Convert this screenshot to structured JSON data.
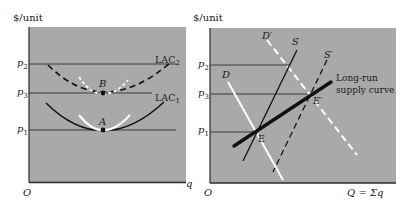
{
  "colors": {
    "background": "#ffffff",
    "panel": "#a9a9a9",
    "axis": "#2a2a2a",
    "price_line": "#3a3a3a",
    "curve_dark": "#111111",
    "curve_white": "#ffffff"
  },
  "left_panel": {
    "y_axis_label": "$/unit",
    "x_axis_label": "q",
    "origin_label": "O",
    "price_levels": [
      {
        "label": "p",
        "sub": "2"
      },
      {
        "label": "p",
        "sub": "3"
      },
      {
        "label": "p",
        "sub": "1"
      }
    ],
    "curves": [
      {
        "label": "LAC",
        "sub": "2",
        "style": "dashed-black"
      },
      {
        "label": "LAC",
        "sub": "1",
        "style": "solid-black"
      }
    ],
    "points": [
      {
        "label": "B"
      },
      {
        "label": "A"
      }
    ]
  },
  "right_panel": {
    "y_axis_label": "$/unit",
    "x_axis_label": "Q = Σq",
    "origin_label": "O",
    "price_levels": [
      {
        "label": "p",
        "sub": "2"
      },
      {
        "label": "p",
        "sub": "3"
      },
      {
        "label": "p",
        "sub": "1"
      }
    ],
    "curves": [
      {
        "label": "D",
        "style": "solid-white"
      },
      {
        "label": "D′",
        "style": "dashed-white"
      },
      {
        "label": "S",
        "style": "solid-black"
      },
      {
        "label": "S′",
        "style": "dashed-black"
      },
      {
        "label": "Long-run supply curve",
        "line1": "Long-run",
        "line2": "supply curve",
        "style": "thick-black"
      }
    ],
    "points": [
      {
        "label": "E"
      },
      {
        "label": "E′"
      }
    ]
  }
}
